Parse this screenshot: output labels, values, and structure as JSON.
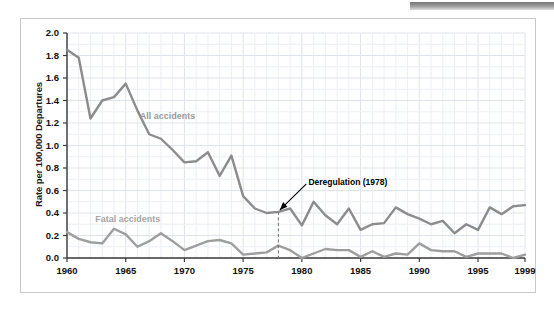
{
  "figure": {
    "background_color": "#ffffff",
    "frame_color": "#c9c9c9",
    "grid_color": "#dfe3ea",
    "minor_grid_color": "#eceff4"
  },
  "chart_data": {
    "type": "line",
    "title": "",
    "subtitle": "",
    "xlabel": "",
    "ylabel": "Rate per 100,000 Departures",
    "xlim": [
      1960,
      1999
    ],
    "ylim": [
      0.0,
      2.0
    ],
    "grid": true,
    "legend_position": "inline-labels",
    "y_ticks": [
      "0.0",
      "0.2",
      "0.4",
      "0.6",
      "0.8",
      "1.0",
      "1.2",
      "1.4",
      "1.6",
      "1.8",
      "2.0"
    ],
    "y_tick_values": [
      0.0,
      0.2,
      0.4,
      0.6,
      0.8,
      1.0,
      1.2,
      1.4,
      1.6,
      1.8,
      2.0
    ],
    "x_ticks": [
      "1960",
      "1965",
      "1970",
      "1975",
      "1980",
      "1985",
      "1990",
      "1995",
      "1999"
    ],
    "x_tick_values": [
      1960,
      1965,
      1970,
      1975,
      1980,
      1985,
      1990,
      1995,
      1999
    ],
    "x": [
      1960,
      1961,
      1962,
      1963,
      1964,
      1965,
      1966,
      1967,
      1968,
      1969,
      1970,
      1971,
      1972,
      1973,
      1974,
      1975,
      1976,
      1977,
      1978,
      1979,
      1980,
      1981,
      1982,
      1983,
      1984,
      1985,
      1986,
      1987,
      1988,
      1989,
      1990,
      1991,
      1992,
      1993,
      1994,
      1995,
      1996,
      1997,
      1998,
      1999
    ],
    "series": [
      {
        "name": "All accidents",
        "color": "#8c8c8c",
        "label_color": "#9a9a9a",
        "values": [
          1.85,
          1.78,
          1.24,
          1.4,
          1.43,
          1.55,
          1.31,
          1.1,
          1.06,
          0.96,
          0.85,
          0.86,
          0.94,
          0.73,
          0.91,
          0.55,
          0.44,
          0.4,
          0.41,
          0.44,
          0.29,
          0.5,
          0.38,
          0.3,
          0.44,
          0.25,
          0.3,
          0.31,
          0.45,
          0.39,
          0.35,
          0.3,
          0.33,
          0.22,
          0.3,
          0.25,
          0.45,
          0.39,
          0.46,
          0.47
        ]
      },
      {
        "name": "Fatal accidents",
        "color": "#9e9e9e",
        "label_color": "#a5a5a5",
        "values": [
          0.23,
          0.17,
          0.14,
          0.13,
          0.26,
          0.21,
          0.1,
          0.15,
          0.22,
          0.15,
          0.07,
          0.11,
          0.15,
          0.16,
          0.13,
          0.03,
          0.04,
          0.05,
          0.11,
          0.07,
          0.0,
          0.04,
          0.08,
          0.07,
          0.07,
          0.01,
          0.06,
          0.01,
          0.04,
          0.03,
          0.13,
          0.07,
          0.06,
          0.06,
          0.01,
          0.04,
          0.04,
          0.04,
          0.0,
          0.03
        ]
      }
    ],
    "annotations": [
      {
        "text": "Deregulation (1978)",
        "x": 1978,
        "y": 0.41,
        "marker": "dashed-vertical-line-with-arrow"
      }
    ]
  }
}
